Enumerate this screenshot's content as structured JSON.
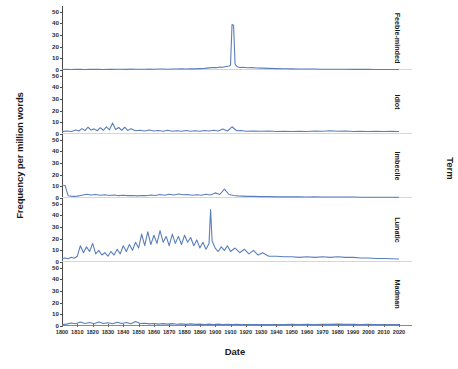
{
  "chart_data": {
    "type": "line",
    "title": "",
    "xlabel": "Date",
    "ylabel": "Frequency per million words",
    "facet_title": "Term",
    "xlim": [
      1800,
      2020
    ],
    "ylim": [
      0,
      55
    ],
    "yticks": [
      0,
      10,
      20,
      30,
      40,
      50
    ],
    "xticks": [
      1800,
      1810,
      1820,
      1830,
      1840,
      1850,
      1860,
      1870,
      1880,
      1890,
      1900,
      1910,
      1920,
      1930,
      1940,
      1950,
      1960,
      1970,
      1980,
      1990,
      2000,
      2010,
      2020
    ],
    "grid": false,
    "legend": "none",
    "line_color": "#5b7fbd",
    "series": [
      {
        "name": "Feeble-minded",
        "x": [
          1800,
          1803,
          1806,
          1809,
          1812,
          1815,
          1818,
          1821,
          1824,
          1827,
          1830,
          1833,
          1836,
          1839,
          1842,
          1845,
          1848,
          1851,
          1854,
          1857,
          1860,
          1863,
          1866,
          1869,
          1872,
          1875,
          1878,
          1881,
          1884,
          1887,
          1890,
          1893,
          1896,
          1899,
          1901,
          1903,
          1905,
          1907,
          1909,
          1910,
          1911,
          1912,
          1913,
          1914,
          1915,
          1916,
          1918,
          1921,
          1924,
          1927,
          1930,
          1935,
          1940,
          1945,
          1950,
          1955,
          1960,
          1965,
          1970,
          1975,
          1980,
          1985,
          1990,
          1995,
          2000,
          2005,
          2010,
          2015,
          2020
        ],
        "y": [
          0.4,
          0.5,
          0.4,
          0.6,
          0.5,
          0.4,
          0.5,
          0.6,
          0.5,
          0.4,
          0.6,
          0.5,
          0.7,
          0.6,
          0.5,
          0.8,
          0.6,
          0.7,
          0.6,
          0.8,
          0.7,
          0.9,
          0.8,
          0.7,
          0.9,
          0.8,
          1.0,
          0.9,
          1.1,
          1.0,
          1.2,
          1.4,
          1.8,
          2.2,
          2.0,
          2.6,
          2.4,
          3.0,
          3.4,
          4.0,
          39.0,
          38.5,
          5.0,
          3.2,
          2.6,
          2.2,
          2.4,
          1.9,
          2.0,
          1.7,
          1.6,
          1.4,
          1.2,
          1.1,
          1.0,
          0.9,
          0.8,
          0.8,
          0.7,
          0.7,
          0.6,
          0.6,
          0.5,
          0.5,
          0.5,
          0.4,
          0.4,
          0.4,
          0.4
        ]
      },
      {
        "name": "Idiot",
        "x": [
          1800,
          1803,
          1806,
          1809,
          1811,
          1813,
          1815,
          1817,
          1819,
          1821,
          1823,
          1825,
          1827,
          1829,
          1831,
          1833,
          1835,
          1837,
          1839,
          1841,
          1843,
          1845,
          1848,
          1851,
          1854,
          1857,
          1860,
          1863,
          1866,
          1869,
          1872,
          1875,
          1878,
          1881,
          1884,
          1887,
          1890,
          1893,
          1896,
          1899,
          1902,
          1905,
          1908,
          1911,
          1914,
          1917,
          1920,
          1925,
          1930,
          1935,
          1940,
          1945,
          1950,
          1955,
          1960,
          1965,
          1970,
          1975,
          1980,
          1985,
          1990,
          1995,
          2000,
          2005,
          2010,
          2015,
          2020
        ],
        "y": [
          2.0,
          2.6,
          2.2,
          3.4,
          2.6,
          4.6,
          3.0,
          5.8,
          3.4,
          4.4,
          2.8,
          5.4,
          3.2,
          6.2,
          3.6,
          9.4,
          3.8,
          5.6,
          3.2,
          5.8,
          3.0,
          4.6,
          2.8,
          3.2,
          2.6,
          3.4,
          2.6,
          3.0,
          2.4,
          3.2,
          2.4,
          2.8,
          2.4,
          3.0,
          2.4,
          2.8,
          2.4,
          3.0,
          2.6,
          3.2,
          2.6,
          4.4,
          2.6,
          6.2,
          2.8,
          3.0,
          2.4,
          2.6,
          2.4,
          2.6,
          2.2,
          2.4,
          2.2,
          2.4,
          2.2,
          2.6,
          2.4,
          2.8,
          2.4,
          2.6,
          2.2,
          2.4,
          2.2,
          2.4,
          2.2,
          2.4,
          2.2
        ]
      },
      {
        "name": "Imbecile",
        "x": [
          1800,
          1802,
          1804,
          1806,
          1808,
          1810,
          1813,
          1816,
          1819,
          1822,
          1825,
          1828,
          1831,
          1834,
          1837,
          1840,
          1843,
          1846,
          1849,
          1852,
          1855,
          1858,
          1861,
          1864,
          1867,
          1870,
          1873,
          1876,
          1879,
          1882,
          1885,
          1888,
          1891,
          1894,
          1897,
          1900,
          1903,
          1906,
          1909,
          1912,
          1915,
          1918,
          1921,
          1925,
          1930,
          1935,
          1940,
          1945,
          1950,
          1955,
          1960,
          1965,
          1970,
          1975,
          1980,
          1985,
          1990,
          1995,
          2000,
          2005,
          2010,
          2015,
          2020
        ],
        "y": [
          11.0,
          10.8,
          2.0,
          1.6,
          1.4,
          1.6,
          2.4,
          3.2,
          2.6,
          3.0,
          2.4,
          2.8,
          2.2,
          2.6,
          2.0,
          2.4,
          2.0,
          2.2,
          1.8,
          2.2,
          2.0,
          2.6,
          2.2,
          3.0,
          2.4,
          3.2,
          2.6,
          3.4,
          2.8,
          3.0,
          2.4,
          2.8,
          2.4,
          3.2,
          2.6,
          4.4,
          3.0,
          7.6,
          3.0,
          2.2,
          1.8,
          1.6,
          1.4,
          1.4,
          1.2,
          1.2,
          1.0,
          1.0,
          1.0,
          1.0,
          0.9,
          1.0,
          0.9,
          0.9,
          0.8,
          0.8,
          0.8,
          0.7,
          0.7,
          0.7,
          0.6,
          0.6,
          0.6
        ]
      },
      {
        "name": "Lunatic",
        "x": [
          1800,
          1802,
          1804,
          1806,
          1808,
          1810,
          1812,
          1814,
          1816,
          1818,
          1820,
          1822,
          1824,
          1826,
          1828,
          1830,
          1832,
          1834,
          1836,
          1838,
          1840,
          1842,
          1844,
          1846,
          1848,
          1850,
          1852,
          1854,
          1856,
          1858,
          1860,
          1862,
          1864,
          1866,
          1868,
          1870,
          1872,
          1874,
          1876,
          1878,
          1880,
          1882,
          1884,
          1886,
          1888,
          1890,
          1892,
          1894,
          1896,
          1897,
          1898,
          1900,
          1902,
          1904,
          1906,
          1908,
          1910,
          1913,
          1916,
          1919,
          1922,
          1925,
          1928,
          1931,
          1935,
          1940,
          1945,
          1950,
          1955,
          1960,
          1965,
          1970,
          1975,
          1980,
          1985,
          1990,
          1995,
          2000,
          2005,
          2010,
          2015,
          2020
        ],
        "y": [
          3.0,
          3.4,
          2.8,
          4.0,
          3.2,
          5.0,
          14.0,
          8.0,
          13.0,
          9.0,
          16.0,
          7.0,
          10.0,
          6.0,
          8.0,
          5.0,
          9.0,
          6.0,
          11.0,
          7.0,
          14.0,
          9.0,
          15.0,
          10.0,
          17.0,
          12.0,
          24.0,
          14.0,
          26.0,
          15.0,
          23.0,
          16.0,
          27.0,
          17.0,
          22.0,
          14.0,
          24.0,
          16.0,
          22.0,
          15.0,
          23.0,
          17.0,
          21.0,
          14.0,
          19.0,
          12.0,
          17.0,
          11.0,
          16.0,
          45.0,
          18.0,
          12.0,
          9.0,
          13.0,
          10.0,
          14.0,
          9.0,
          12.0,
          8.0,
          11.0,
          7.0,
          10.0,
          6.0,
          8.0,
          5.0,
          5.0,
          4.5,
          4.5,
          4.0,
          4.5,
          4.0,
          4.5,
          4.0,
          4.5,
          4.0,
          4.0,
          3.5,
          3.5,
          3.0,
          3.0,
          2.8,
          2.6
        ]
      },
      {
        "name": "Madman",
        "x": [
          1800,
          1803,
          1806,
          1809,
          1812,
          1815,
          1818,
          1821,
          1824,
          1827,
          1830,
          1833,
          1836,
          1839,
          1842,
          1845,
          1848,
          1851,
          1854,
          1857,
          1860,
          1863,
          1866,
          1869,
          1872,
          1875,
          1878,
          1881,
          1884,
          1887,
          1890,
          1893,
          1896,
          1899,
          1902,
          1905,
          1908,
          1911,
          1914,
          1917,
          1920,
          1925,
          1930,
          1935,
          1940,
          1945,
          1950,
          1955,
          1960,
          1965,
          1970,
          1975,
          1980,
          1985,
          1990,
          1995,
          2000,
          2005,
          2010,
          2015,
          2020
        ],
        "y": [
          1.2,
          1.6,
          2.6,
          2.0,
          3.4,
          2.2,
          3.0,
          2.0,
          3.4,
          2.2,
          2.8,
          2.0,
          3.2,
          2.2,
          3.0,
          2.0,
          3.8,
          2.2,
          2.4,
          1.8,
          2.2,
          1.6,
          2.0,
          1.6,
          2.0,
          1.5,
          1.8,
          1.4,
          1.8,
          1.4,
          1.6,
          1.3,
          1.6,
          1.3,
          1.6,
          1.2,
          1.5,
          1.2,
          1.4,
          1.2,
          1.3,
          1.2,
          1.3,
          1.2,
          1.3,
          1.2,
          1.4,
          1.3,
          1.5,
          1.3,
          1.5,
          1.4,
          1.6,
          1.4,
          1.5,
          1.3,
          1.4,
          1.3,
          1.3,
          1.2,
          1.2
        ]
      }
    ]
  },
  "axis": {
    "y_title": "Frequency per million words",
    "x_title": "Date",
    "facet_title": "Term"
  }
}
